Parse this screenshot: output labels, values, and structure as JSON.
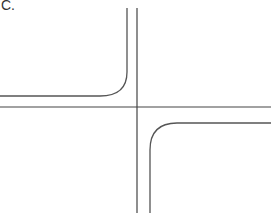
{
  "figure": {
    "panel_label": "C.",
    "colors": {
      "background": "#ffffff",
      "axis": "#444444",
      "curve": "#555555"
    },
    "axes": {
      "origin": [
        137,
        107
      ],
      "x_axis": {
        "from": [
          0,
          107
        ],
        "to": [
          271,
          107
        ]
      },
      "y_axis": {
        "from": [
          137,
          8
        ],
        "to": [
          137,
          213
        ]
      }
    },
    "curves": [
      {
        "name": "upper-left-hyperbola",
        "quadrant": "II",
        "path": "M 127 8 L 127 72 Q 127 96 100 96 L 0 96"
      },
      {
        "name": "lower-right-hyperbola",
        "quadrant": "IV",
        "path": "M 150 213 L 150 150 Q 150 123 177 123 L 271 123"
      }
    ]
  }
}
